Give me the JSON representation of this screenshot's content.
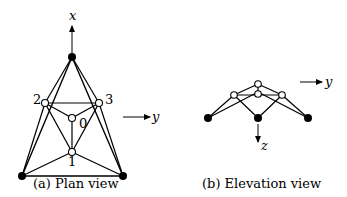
{
  "figure": {
    "panels": [
      {
        "id": "plan",
        "caption": "(a) Plan view",
        "axes": {
          "x": "x",
          "y": "y"
        },
        "node_labels": {
          "n0": "0",
          "n1": "1",
          "n2": "2",
          "n3": "3"
        }
      },
      {
        "id": "elevation",
        "caption": "(b) Elevation view",
        "axes": {
          "y": "y",
          "z": "z"
        }
      }
    ],
    "colors": {
      "line": "#000000",
      "free_node_fill": "#ffffff",
      "support_fill": "#000000"
    }
  }
}
